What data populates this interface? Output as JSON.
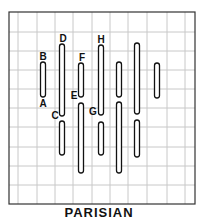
{
  "diagram": {
    "title": "PARISIAN",
    "grid": {
      "left": 9,
      "top": 12,
      "right": 195,
      "bottom": 204,
      "vlines": [
        18,
        37,
        55,
        73,
        92,
        110,
        128,
        147,
        167,
        185
      ],
      "hlines": [
        32,
        51,
        70,
        89,
        108,
        127,
        147,
        166,
        185
      ],
      "line_color": "#c8c8c8",
      "border_color": "#333333"
    },
    "stitches": [
      {
        "x": 43,
        "y1": 62,
        "y2": 97
      },
      {
        "x": 62,
        "y1": 44,
        "y2": 116
      },
      {
        "x": 62,
        "y1": 121,
        "y2": 155
      },
      {
        "x": 81,
        "y1": 63,
        "y2": 97
      },
      {
        "x": 81,
        "y1": 103,
        "y2": 173
      },
      {
        "x": 101,
        "y1": 45,
        "y2": 115
      },
      {
        "x": 101,
        "y1": 122,
        "y2": 155
      },
      {
        "x": 119,
        "y1": 62,
        "y2": 97
      },
      {
        "x": 119,
        "y1": 102,
        "y2": 173
      },
      {
        "x": 137,
        "y1": 43,
        "y2": 114
      },
      {
        "x": 137,
        "y1": 120,
        "y2": 157
      },
      {
        "x": 157,
        "y1": 63,
        "y2": 98
      }
    ],
    "labels": [
      {
        "text": "B",
        "x": 43,
        "y": 60
      },
      {
        "text": "A",
        "x": 43,
        "y": 107
      },
      {
        "text": "D",
        "x": 63,
        "y": 42
      },
      {
        "text": "C",
        "x": 55,
        "y": 119
      },
      {
        "text": "F",
        "x": 82,
        "y": 61
      },
      {
        "text": "E",
        "x": 74,
        "y": 99
      },
      {
        "text": "H",
        "x": 101,
        "y": 43
      },
      {
        "text": "G",
        "x": 93,
        "y": 115
      }
    ]
  }
}
